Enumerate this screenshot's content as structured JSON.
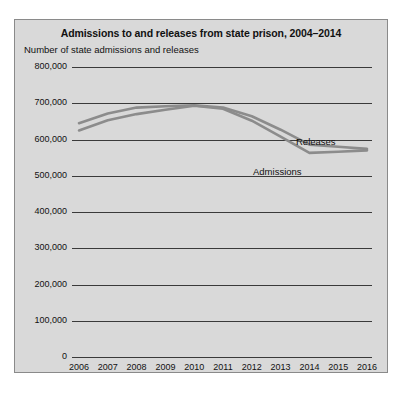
{
  "chart_data": {
    "type": "line",
    "title": "Admissions to and releases from state prison, 2004–2014",
    "ylabel": "Number of state admissions and releases",
    "xlabel": "",
    "x": [
      2006,
      2007,
      2008,
      2009,
      2010,
      2011,
      2012,
      2013,
      2014,
      2015,
      2016
    ],
    "xticklabels": [
      "2006",
      "2007",
      "2008",
      "2009",
      "2010",
      "2011",
      "2012",
      "2013",
      "2014",
      "2015",
      "2016"
    ],
    "yticklabels": [
      "0",
      "100,000",
      "200,000",
      "300,000",
      "400,000",
      "500,000",
      "600,000",
      "700,000",
      "800,000"
    ],
    "yticks": [
      0,
      100000,
      200000,
      300000,
      400000,
      500000,
      600000,
      700000,
      800000
    ],
    "ylim": [
      0,
      800000
    ],
    "grid": true,
    "legend_position": "inline-annotation",
    "series": [
      {
        "name": "Releases",
        "color": "#8c8c8c",
        "label_x": 2013,
        "values": [
          645000,
          672000,
          688000,
          692000,
          694000,
          688000,
          664000,
          627000,
          586000,
          580000,
          574000
        ]
      },
      {
        "name": "Admissions",
        "color": "#8c8c8c",
        "label_x": 2012,
        "values": [
          625000,
          653000,
          670000,
          682000,
          693000,
          685000,
          652000,
          608000,
          563000,
          566000,
          570000
        ]
      }
    ]
  },
  "figure": {
    "background_color": "#d9d9d9",
    "border_color": "#8a8a8a",
    "axis_color": "#3a3a3a"
  }
}
